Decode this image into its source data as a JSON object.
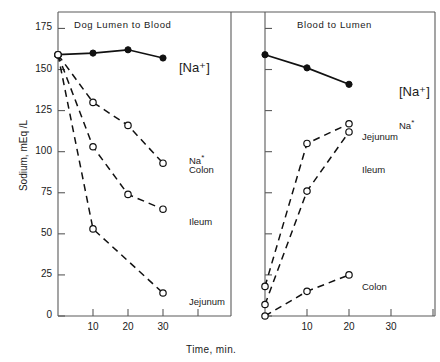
{
  "figure": {
    "axis_label_y": "Sodium, mEq /L",
    "axis_label_x": "Time, min.",
    "y_ticks": [
      "175",
      "150",
      "125",
      "100",
      "75",
      "50",
      "25",
      "0"
    ],
    "y_tick_values": [
      175,
      150,
      125,
      100,
      75,
      50,
      25,
      0
    ],
    "x_ticks": [
      "10",
      "20",
      "30"
    ],
    "x_tick_values": [
      10,
      20,
      30
    ],
    "panels": [
      {
        "title": "Dog Lumen to Blood"
      },
      {
        "title": "Blood to Lumen"
      }
    ],
    "annotations": {
      "na_bracket_left": "[Na⁺]",
      "na_bracket_right": "[Na⁺]",
      "na_star": "Na",
      "star": "*",
      "colon_left": "Colon",
      "ileum_left": "Ileum",
      "jejunum_left": "Jejunum",
      "jejunum_right": "Jejunum",
      "ileum_right": "Ileum",
      "colon_right": "Colon"
    }
  },
  "chart_data": {
    "type": "line",
    "xlabel": "Time, min.",
    "ylabel": "Sodium, mEq /L",
    "xlim": [
      0,
      40
    ],
    "ylim": [
      0,
      185
    ],
    "grid": false,
    "legend": "inline-annotations",
    "panels": [
      {
        "title": "Dog Lumen to Blood",
        "series": [
          {
            "name": "[Na+]",
            "marker": "filled-circle",
            "linestyle": "solid",
            "x": [
              0,
              10,
              20,
              30
            ],
            "y": [
              159,
              160,
              162,
              157
            ]
          },
          {
            "name": "Na* Colon",
            "marker": "open-circle",
            "linestyle": "dashed",
            "x": [
              0,
              10,
              20,
              30
            ],
            "y": [
              159,
              130,
              116,
              93
            ]
          },
          {
            "name": "Na* Ileum",
            "marker": "open-circle",
            "linestyle": "dashed",
            "x": [
              0,
              10,
              20,
              30
            ],
            "y": [
              159,
              103,
              74,
              65
            ]
          },
          {
            "name": "Na* Jejunum",
            "marker": "open-circle",
            "linestyle": "dashed",
            "x": [
              0,
              10,
              30
            ],
            "y": [
              159,
              53,
              14
            ]
          }
        ]
      },
      {
        "title": "Blood to Lumen",
        "series": [
          {
            "name": "[Na+]",
            "marker": "filled-circle",
            "linestyle": "solid",
            "x": [
              0,
              10,
              20
            ],
            "y": [
              159,
              151,
              141
            ]
          },
          {
            "name": "Na* Jejunum",
            "marker": "open-circle",
            "linestyle": "dashed",
            "x": [
              0,
              10,
              20
            ],
            "y": [
              18,
              105,
              117
            ]
          },
          {
            "name": "Na* Ileum",
            "marker": "open-circle",
            "linestyle": "dashed",
            "x": [
              0,
              10,
              20
            ],
            "y": [
              7,
              76,
              112
            ]
          },
          {
            "name": "Na* Colon",
            "marker": "open-circle",
            "linestyle": "dashed",
            "x": [
              0,
              10,
              20
            ],
            "y": [
              0,
              15,
              25
            ]
          }
        ]
      }
    ]
  }
}
